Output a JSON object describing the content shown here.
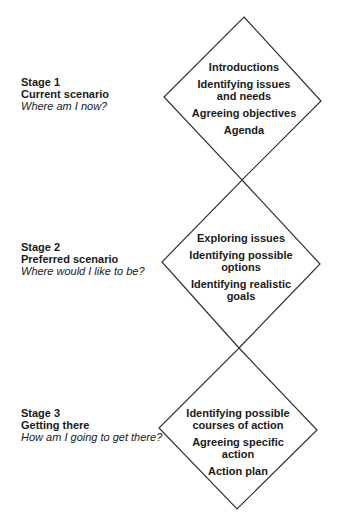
{
  "diagram": {
    "line_color": "#333333",
    "diamonds": [
      {
        "points": [
          [
            244,
            17
          ],
          [
            321,
            101
          ],
          [
            242,
            180
          ],
          [
            164,
            97
          ]
        ]
      },
      {
        "points": [
          [
            242,
            180
          ],
          [
            320,
            264
          ],
          [
            239,
            348
          ],
          [
            162,
            262
          ]
        ]
      },
      {
        "points": [
          [
            239,
            348
          ],
          [
            317,
            430
          ],
          [
            237,
            509
          ],
          [
            159,
            428
          ]
        ]
      }
    ]
  },
  "stages": [
    {
      "number": "Stage 1",
      "name": "Current scenario",
      "question": "Where am I now?",
      "items": [
        "Introductions",
        "Identifying issues\nand needs",
        "Agreeing objectives",
        "Agenda"
      ]
    },
    {
      "number": "Stage 2",
      "name": "Preferred scenario",
      "question": "Where would I like to be?",
      "items": [
        "Exploring issues",
        "Identifying possible\noptions",
        "Identifying realistic\ngoals"
      ]
    },
    {
      "number": "Stage 3",
      "name": "Getting there",
      "question": "How am I going to get there?",
      "items": [
        "Identifying possible\ncourses of action",
        "Agreeing specific\naction",
        "Action plan"
      ]
    }
  ]
}
